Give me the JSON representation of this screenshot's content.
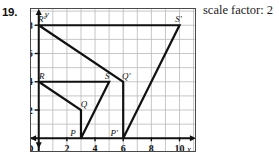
{
  "problem": {
    "number": "19.",
    "caption": "scale factor: 2"
  },
  "axes": {
    "x_label": "x",
    "y_label": "y",
    "origin_label": "O",
    "x_ticks": [
      "2",
      "4",
      "6",
      "8",
      "10"
    ],
    "x_tick_values": [
      2,
      4,
      6,
      8,
      10
    ],
    "y_ticks": [
      "2",
      "4",
      "6",
      "8"
    ],
    "y_tick_values": [
      2,
      4,
      6,
      8
    ],
    "x_range": [
      -0.55,
      11.1
    ],
    "y_range": [
      -0.9,
      9.15
    ],
    "grid": true
  },
  "chart_data": {
    "type": "scatter",
    "title": "",
    "xlabel": "x",
    "ylabel": "y",
    "xlim": [
      -0.55,
      11.1
    ],
    "ylim": [
      -0.9,
      9.15
    ],
    "grid": true,
    "legend": "none",
    "annotations": [
      "scale factor: 2"
    ],
    "series": [
      {
        "name": "preimage PQRS",
        "closed": true,
        "points": [
          {
            "label": "P",
            "x": 3,
            "y": 0
          },
          {
            "label": "Q",
            "x": 3,
            "y": 2
          },
          {
            "label": "R",
            "x": 0,
            "y": 4
          },
          {
            "label": "S",
            "x": 5,
            "y": 4
          }
        ],
        "path_order": [
          "R",
          "Q",
          "P",
          "S",
          "R"
        ]
      },
      {
        "name": "image P'Q'R'S'",
        "closed": true,
        "points": [
          {
            "label": "P'",
            "x": 6,
            "y": 0
          },
          {
            "label": "Q'",
            "x": 6,
            "y": 4
          },
          {
            "label": "R'",
            "x": 0,
            "y": 8
          },
          {
            "label": "S'",
            "x": 10,
            "y": 8
          }
        ],
        "path_order": [
          "R'",
          "Q'",
          "P'",
          "S'",
          "R'"
        ]
      }
    ]
  },
  "vertex_labels": {
    "P": "P",
    "Q": "Q",
    "R": "R",
    "S": "S",
    "Pp": "P'",
    "Qp": "Q'",
    "Rp": "R'",
    "Sp": "S'"
  },
  "colors": {
    "ink": "#111111",
    "grid": "#b9b9b9",
    "axis": "#111111",
    "frame": "#4a4a4a",
    "background": "#ffffff"
  }
}
